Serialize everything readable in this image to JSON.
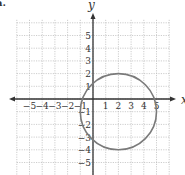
{
  "panel_label": "a.",
  "chart_data": {
    "type": "line",
    "title": "",
    "xlabel": "x",
    "ylabel": "y",
    "xlim": [
      -6,
      6
    ],
    "ylim": [
      -6,
      6
    ],
    "grid": true,
    "x_ticks": [
      -5,
      -4,
      -3,
      -2,
      -1,
      1,
      2,
      3,
      4,
      5
    ],
    "y_ticks": [
      -5,
      -4,
      -3,
      -2,
      -1,
      1,
      2,
      3,
      4,
      5
    ],
    "x_tick_labels": [
      "−5",
      "−4",
      "−3",
      "−2",
      "−1",
      "1",
      "2",
      "3",
      "4",
      "5"
    ],
    "y_tick_labels": [
      "−5",
      "−4",
      "−3",
      "−2",
      "−1",
      "1",
      "2",
      "3",
      "4",
      "5"
    ],
    "series": [
      {
        "name": "circle",
        "shape": "circle",
        "center": [
          2,
          -1
        ],
        "radius": 3,
        "equation": "(x-2)^2 + (y+1)^2 = 9",
        "color": "#7a7a7a"
      }
    ],
    "legend": null
  },
  "layout": {
    "origin_px": [
      93,
      99
    ],
    "unit_px": 12.7,
    "grid_min": -6,
    "grid_max": 6
  }
}
